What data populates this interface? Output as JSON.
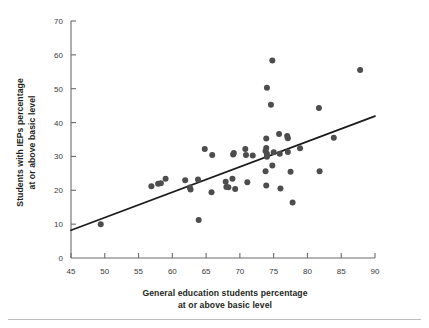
{
  "figure": {
    "background": "#ffffff",
    "point_color": "#4d4d4d",
    "line_color": "#1a1a1a",
    "axis_color": "#6b6b6b"
  },
  "chart_data": {
    "type": "scatter",
    "title": "",
    "xlabel": "General education students percentage at or above basic level",
    "ylabel": "Students with IEPs percentage at or above basic level",
    "xlabel_line1": "General education students percentage",
    "xlabel_line2": "at or above basic level",
    "ylabel_line1": "Students with IEPs percentage",
    "ylabel_line2": "at or above basic level",
    "xlim": [
      45,
      90
    ],
    "ylim": [
      0,
      70
    ],
    "xticks": [
      45,
      50,
      55,
      60,
      65,
      70,
      75,
      80,
      85,
      90
    ],
    "yticks": [
      0,
      10,
      20,
      30,
      40,
      50,
      60,
      70
    ],
    "xtick_labels": [
      "45",
      "50",
      "55",
      "60",
      "65",
      "70",
      "75",
      "80",
      "85",
      "90"
    ],
    "ytick_labels": [
      "0",
      "10",
      "20",
      "30",
      "40",
      "50",
      "60",
      "70"
    ],
    "grid": false,
    "legend": null,
    "points": [
      [
        49.4,
        10.0
      ],
      [
        56.9,
        21.2
      ],
      [
        57.9,
        21.9
      ],
      [
        58.3,
        22.1
      ],
      [
        59.0,
        23.4
      ],
      [
        61.9,
        23.0
      ],
      [
        62.6,
        20.8
      ],
      [
        62.7,
        20.2
      ],
      [
        63.9,
        11.2
      ],
      [
        63.8,
        23.2
      ],
      [
        64.8,
        32.2
      ],
      [
        65.9,
        30.4
      ],
      [
        65.8,
        19.4
      ],
      [
        67.9,
        22.5
      ],
      [
        68.0,
        21.0
      ],
      [
        68.3,
        20.9
      ],
      [
        68.9,
        23.4
      ],
      [
        69.0,
        30.6
      ],
      [
        69.1,
        31.0
      ],
      [
        69.3,
        20.4
      ],
      [
        70.8,
        32.2
      ],
      [
        70.9,
        30.4
      ],
      [
        71.1,
        22.4
      ],
      [
        71.9,
        30.3
      ],
      [
        73.8,
        31.6
      ],
      [
        73.9,
        32.5
      ],
      [
        74.0,
        30.8
      ],
      [
        74.0,
        29.9
      ],
      [
        73.9,
        35.3
      ],
      [
        73.8,
        25.6
      ],
      [
        73.9,
        21.4
      ],
      [
        74.0,
        50.3
      ],
      [
        74.8,
        58.3
      ],
      [
        74.6,
        45.3
      ],
      [
        74.8,
        27.3
      ],
      [
        75.0,
        31.2
      ],
      [
        75.8,
        36.6
      ],
      [
        75.9,
        30.8
      ],
      [
        76.0,
        20.5
      ],
      [
        77.0,
        36.0
      ],
      [
        77.1,
        35.4
      ],
      [
        77.1,
        31.3
      ],
      [
        77.5,
        25.5
      ],
      [
        77.8,
        16.4
      ],
      [
        78.9,
        32.4
      ],
      [
        81.7,
        44.3
      ],
      [
        81.8,
        25.6
      ],
      [
        83.9,
        35.5
      ],
      [
        87.8,
        55.5
      ]
    ],
    "trendline": {
      "x": [
        45,
        90
      ],
      "y": [
        8.2,
        41.9
      ],
      "type": "linear"
    }
  }
}
